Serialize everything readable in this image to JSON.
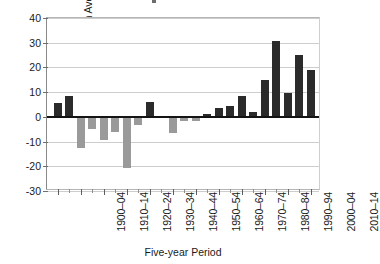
{
  "chart_data": {
    "type": "bar",
    "title": "",
    "xlabel": "Five-year Period",
    "ylabel": "Difference from Average (%)",
    "ylim": [
      -30,
      40
    ],
    "yticks": [
      40,
      30,
      20,
      10,
      0,
      -10,
      -20,
      -30
    ],
    "ytick_labels": [
      "40",
      "30",
      "20",
      "10",
      "0",
      "-10",
      "-20",
      "-30"
    ],
    "grid": true,
    "legend": "none",
    "colors": {
      "positive_bar": "#2b2b2b",
      "negative_bar": "#9a9a9a",
      "gridline": "#cdcdcd",
      "zero_line": "#141414",
      "axis": "#8a8a8a",
      "text": "#1a1a1a"
    },
    "categories": [
      "1900–04",
      "1905–09",
      "1910–14",
      "1915–19",
      "1920–24",
      "1925–29",
      "1930–34",
      "1935–39",
      "1940–44",
      "1945–49",
      "1950–54",
      "1955–59",
      "1960–64",
      "1965–69",
      "1970–74",
      "1975–79",
      "1980–84",
      "1985–89",
      "1990–94",
      "1995–99",
      "2000–04",
      "2005–09",
      "2010–14"
    ],
    "visible_tick_labels": [
      "1900–04",
      "1910–14",
      "1920–24",
      "1930–34",
      "1940–44",
      "1950–54",
      "1960–64",
      "1970–74",
      "1980–84",
      "1990–94",
      "2000–04",
      "2010–14"
    ],
    "values": [
      5.5,
      8.5,
      -12.5,
      -5,
      -9.5,
      -6,
      -20.5,
      -3.5,
      6,
      0.5,
      -6.5,
      -1.5,
      -1.5,
      1,
      3.5,
      4.5,
      8.5,
      2,
      15,
      30.5,
      9.5,
      25,
      19
    ]
  }
}
